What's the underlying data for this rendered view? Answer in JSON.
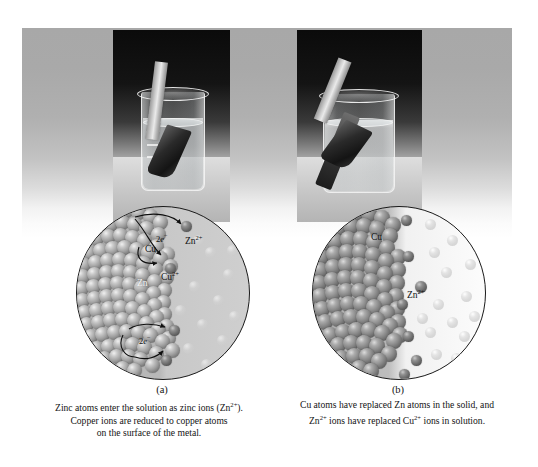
{
  "figure": {
    "panels": [
      {
        "letter": "(a)",
        "caption_lines": [
          "Zinc atoms enter the solution as zinc ions (Zn",
          ").",
          "Copper ions are reduced to copper atoms",
          "on the surface of the metal."
        ],
        "caption_line1_pre": "Zinc atoms enter the solution as zinc ions (Zn",
        "caption_line1_sup": "2+",
        "caption_line1_post": ").",
        "caption_line2": "Copper ions are reduced to copper atoms",
        "caption_line3": "on the surface of the metal.",
        "photo_alt": "Zinc metal strip standing in a beaker of blue copper(II) sulfate solution",
        "labels": {
          "metal_solid": "Cu",
          "metal_substrate": "Zn",
          "ion_leaving": "Zn",
          "ion_leaving_sup": "2+",
          "ion_arriving": "Cu",
          "ion_arriving_sup": "2+",
          "electrons_top_pre": "2",
          "electrons_top_italic": "e",
          "electrons_top_sup": "−",
          "electrons_bottom_pre": "2",
          "electrons_bottom_italic": "e",
          "electrons_bottom_sup": "−"
        }
      },
      {
        "letter": "(b)",
        "caption_line1": "Cu atoms have replaced Zn atoms in the solid, and",
        "caption_line2_pre": "Zn",
        "caption_line2_sup1": "2+",
        "caption_line2_mid": " ions have replaced Cu",
        "caption_line2_sup2": "2+",
        "caption_line2_post": " ions in solution.",
        "photo_alt": "Zinc strip now coated with dark copper metal in a faded beaker solution",
        "labels": {
          "metal_solid": "Cu",
          "ion_in_solution": "Zn",
          "ion_in_solution_sup": "2+"
        }
      }
    ],
    "beaker_graduations": [
      "30",
      "20",
      "10",
      "20"
    ],
    "colors": {
      "ink": "#141414",
      "circle_outline": "#1a1a1a",
      "backdrop_top": "#a8a8a8",
      "backdrop_bottom": "#ffffff",
      "solid_metal": "#9e9e9e",
      "ion_dark": "#6a6a6a",
      "ion_light": "#dedede",
      "page": "#ffffff"
    }
  }
}
